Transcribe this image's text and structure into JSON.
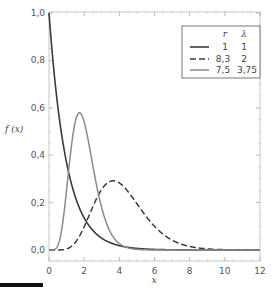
{
  "chart_data": {
    "type": "line",
    "title": "",
    "xlabel": "x",
    "ylabel": "f (x)",
    "xlim": [
      0,
      12
    ],
    "ylim": [
      0,
      1.0
    ],
    "x_ticks": [
      "0",
      "2",
      "4",
      "6",
      "8",
      "10",
      "12"
    ],
    "y_ticks": [
      "0,0",
      "0,2",
      "0,4",
      "0,6",
      "0,8",
      "1,0"
    ],
    "grid": false,
    "legend_position": "upper right",
    "legend_header": {
      "r": "r",
      "lambda": "λ"
    },
    "series": [
      {
        "name": "r=1, λ=1",
        "r": 1,
        "lambda": 1,
        "r_label": "1",
        "lambda_label": "1",
        "style": "solid",
        "color": "#3a3a3a",
        "width": 1.6,
        "peak": {
          "x": 0,
          "y": 1.0
        }
      },
      {
        "name": "r=8.3, λ=2",
        "r": 8.3,
        "lambda": 2,
        "r_label": "8,3",
        "lambda_label": "2",
        "style": "dashed",
        "color": "#3a3a3a",
        "width": 1.5,
        "peak": {
          "x": 3.65,
          "y": 0.29
        }
      },
      {
        "name": "r=7.5, λ=3.75",
        "r": 7.5,
        "lambda": 3.75,
        "r_label": "7,5",
        "lambda_label": "3,75",
        "style": "solid",
        "color": "#8a8a8a",
        "width": 1.5,
        "peak": {
          "x": 1.73,
          "y": 0.58
        }
      }
    ]
  }
}
